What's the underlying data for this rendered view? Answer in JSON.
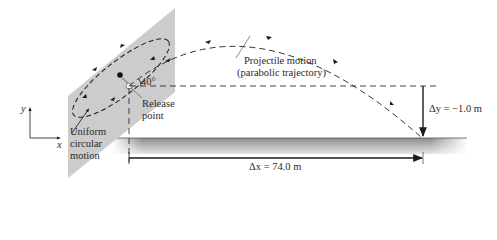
{
  "diagram": {
    "labels": {
      "projectile_line1": "Projectile motion",
      "projectile_line2": "(parabolic trajectory)",
      "angle": "40°",
      "release_line1": "Release",
      "release_line2": "point",
      "uniform_line1": "Uniform",
      "uniform_line2": "circular",
      "uniform_line3": "motion",
      "delta_y": "Δy = −1.0 m",
      "delta_x": "Δx = 74.0 m",
      "axis_x": "x",
      "axis_y": "y"
    },
    "values": {
      "launch_angle_deg": 40,
      "delta_x_m": 74.0,
      "delta_y_m": -1.0
    },
    "colors": {
      "plane": "#c8c8c8",
      "ground": "#9a9a9a",
      "lines": "#1a1a1a"
    }
  }
}
